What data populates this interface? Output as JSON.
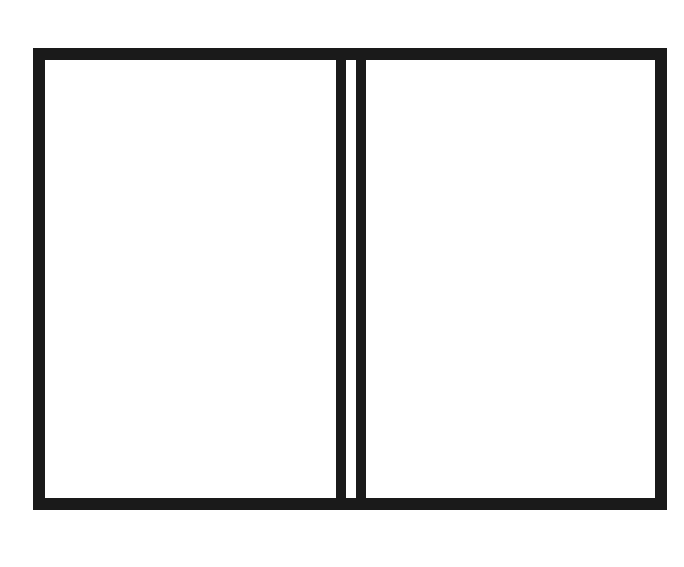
{
  "board": {
    "colors": {
      "frame": "#1a1a1a",
      "background": "#ffffff",
      "shaded_point": "#c8c8c8",
      "ink": "#1a1a1a"
    },
    "top_labels": [
      "24",
      "23",
      "22",
      "21",
      "20",
      "19",
      "18",
      "17",
      "16",
      "15",
      "14",
      "13"
    ],
    "bottom_labels": [
      "1",
      "2",
      "3",
      "4",
      "5",
      "6",
      "7",
      "8",
      "9",
      "10",
      "11",
      "12"
    ],
    "shaded_points_top": [
      23,
      21,
      19,
      17,
      15,
      13
    ],
    "shaded_points_bottom": [
      1,
      3,
      5,
      7,
      9,
      11
    ],
    "checkers": {
      "O": [
        {
          "point": 23,
          "count": 1
        },
        {
          "point": 22,
          "count": 1
        },
        {
          "point": 21,
          "count": 2
        },
        {
          "point": 20,
          "count": 3
        },
        {
          "point": 19,
          "count": 2
        }
      ],
      "X": [
        {
          "point": 2,
          "count": 1
        },
        {
          "point": 3,
          "count": 2
        },
        {
          "point": 4,
          "count": 2
        },
        {
          "point": 5,
          "count": 1
        },
        {
          "point": 6,
          "count": 2
        }
      ]
    }
  }
}
